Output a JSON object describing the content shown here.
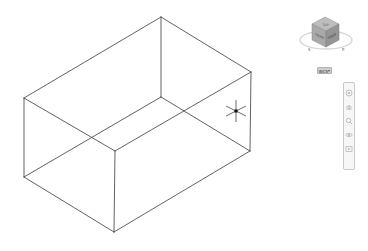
{
  "viewport": {
    "background": "#ffffff",
    "line_color": "#3a3a3a",
    "visual_style": "wireframe",
    "model": {
      "type": "box",
      "vertices": {
        "top_back": [
          161,
          17
        ],
        "top_left": [
          24,
          98
        ],
        "top_right": [
          251,
          72
        ],
        "top_front": [
          115,
          151
        ],
        "bottom_back": [
          161,
          97
        ],
        "bottom_left": [
          24,
          177
        ],
        "bottom_right": [
          250,
          151
        ],
        "bottom_front": [
          114,
          232
        ]
      }
    }
  },
  "viewcube": {
    "faces": [
      "TOP",
      "FRONT",
      "RIGHT"
    ],
    "compass": {
      "left_label": "S",
      "right_label": "E"
    }
  },
  "wcs_menu": {
    "label": "WCS"
  },
  "navigation_bar": {
    "tools": [
      {
        "name": "steering-wheel",
        "glyph": "◎"
      },
      {
        "name": "pan",
        "glyph": "✋"
      },
      {
        "name": "zoom",
        "glyph": "⌕"
      },
      {
        "name": "orbit",
        "glyph": "⟳"
      },
      {
        "name": "showmotion",
        "glyph": "▶"
      }
    ]
  },
  "cursor": {
    "type": "3d-crosshair",
    "position": [
      236,
      111
    ]
  }
}
